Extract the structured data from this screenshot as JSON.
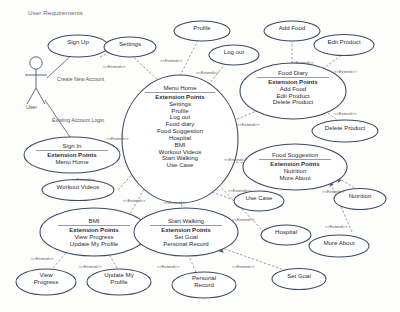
{
  "diagram": {
    "title": "User Requirements",
    "type": "uml-use-case-diagram",
    "stereotype_label": "<<Extend>>",
    "colors": {
      "ellipse_stroke": "#3c4a63",
      "connector": "#8b8b95",
      "association": "#4a5a74",
      "text": "#2b2b33",
      "title_text": "#6b6b72",
      "divider": "#9a9aa4",
      "background": "#fdfdfc"
    }
  },
  "actor": {
    "name": "User",
    "associations": [
      {
        "label": "Create New Account",
        "target": "Sign Up"
      },
      {
        "label": "Existing Account Login",
        "target": "Sign In"
      }
    ]
  },
  "use_cases": [
    {
      "id": "sign_up",
      "title": "Sign Up",
      "lines": []
    },
    {
      "id": "settings",
      "title": "Settings",
      "lines": []
    },
    {
      "id": "profile",
      "title": "Profile",
      "lines": []
    },
    {
      "id": "log_out",
      "title": "Log out",
      "lines": []
    },
    {
      "id": "add_food",
      "title": "Add Food",
      "lines": []
    },
    {
      "id": "edit_product",
      "title": "Edit Product",
      "lines": []
    },
    {
      "id": "delete_product",
      "title": "Delete Product",
      "lines": []
    },
    {
      "id": "workout_videos",
      "title": "Workout Videos",
      "lines": []
    },
    {
      "id": "use_case",
      "title": "Use Case",
      "lines": []
    },
    {
      "id": "nutrition",
      "title": "Nutrition",
      "lines": []
    },
    {
      "id": "hospital",
      "title": "Hospital",
      "lines": []
    },
    {
      "id": "more_about",
      "title": "More About",
      "lines": []
    },
    {
      "id": "set_goal",
      "title": "Set Goal",
      "lines": []
    },
    {
      "id": "view_progress",
      "title": "View",
      "lines": [
        "Progress"
      ]
    },
    {
      "id": "update_profile",
      "title": "Update My",
      "lines": [
        "Profile"
      ]
    },
    {
      "id": "personal_record",
      "title": "Personal",
      "lines": [
        "Record"
      ]
    }
  ],
  "extension_use_cases": [
    {
      "id": "menu_home",
      "title": "Menu Home",
      "ep_header": "Extension Points",
      "points": [
        "Settings",
        "Profile",
        "Log out",
        "Food diary",
        "Food Suggestion",
        "Hospital",
        "BMI",
        "Workout Videos",
        "Start Walking",
        "Use Case"
      ]
    },
    {
      "id": "food_diary",
      "title": "Food Diary",
      "ep_header": "Extension Points",
      "points": [
        "Add Food",
        "Edit Product",
        "Delete Product"
      ]
    },
    {
      "id": "food_suggestion",
      "title": "Food Suggestion",
      "ep_header": "Extension Points",
      "points": [
        "Nutrition",
        "More About"
      ]
    },
    {
      "id": "sign_in",
      "title": "Sign In",
      "ep_header": "Extension Points",
      "points": [
        "Menu Home"
      ]
    },
    {
      "id": "bmi",
      "title": "BMI",
      "ep_header": "Extension Points",
      "points": [
        "View Progress",
        "Update My Profile"
      ]
    },
    {
      "id": "start_walking",
      "title": "Start Walking",
      "ep_header": "Extension Points",
      "points": [
        "Set Goal",
        "Personal Record"
      ]
    }
  ],
  "extend_labels": [
    {
      "id": "e1",
      "text": "<<Extend>>"
    },
    {
      "id": "e2",
      "text": "<<Extend>>"
    },
    {
      "id": "e3",
      "text": "<<Extend>>"
    },
    {
      "id": "e4",
      "text": "<<Extend>>"
    },
    {
      "id": "e5",
      "text": "<<Extend>>"
    },
    {
      "id": "e6",
      "text": "<<Extend>>"
    },
    {
      "id": "e7",
      "text": "<<Extend>>"
    },
    {
      "id": "e8",
      "text": "<<Extend>>"
    },
    {
      "id": "e9",
      "text": "<<Extend>>"
    },
    {
      "id": "e10",
      "text": "<<Extend>>"
    },
    {
      "id": "e11",
      "text": "<<Extend>>"
    },
    {
      "id": "e12",
      "text": "<<Extend>>"
    },
    {
      "id": "e13",
      "text": "<<Extend>>"
    },
    {
      "id": "e14",
      "text": "<<Extend>>"
    },
    {
      "id": "e15",
      "text": "<<Extend>>"
    },
    {
      "id": "e16",
      "text": "<<Extend>>"
    },
    {
      "id": "e17",
      "text": "<<Extend>>"
    },
    {
      "id": "e18",
      "text": "<<Extend>>"
    },
    {
      "id": "e19",
      "text": "<<Extend>>"
    },
    {
      "id": "e20",
      "text": "<<Extend>>"
    },
    {
      "id": "e21",
      "text": "<<Extend>>"
    }
  ]
}
